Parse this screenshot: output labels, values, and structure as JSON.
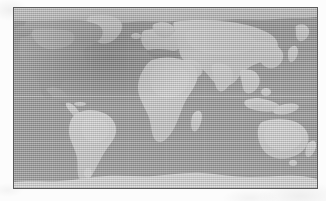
{
  "image": {
    "kind": "world-map",
    "title": "World Map",
    "projection": "equirectangular",
    "style": "grayscale halftone scanline",
    "width_px": 326,
    "height_px": 201,
    "alt_text": "Low-contrast grayscale world map with horizontal scanline texture inside a thin dark rectangular border"
  },
  "frame": {
    "border_color": "#5a5a5a",
    "border_width_px": 1,
    "left_px": 13,
    "top_px": 7,
    "width_px": 305,
    "height_px": 182
  },
  "colors": {
    "page_background": "#fcfcfc",
    "ocean": "#9b9b9b",
    "land": "#c9c9c9",
    "land_shadow": "#8e8e8e",
    "antarctica": "#d2d2d2",
    "border": "#5a5a5a",
    "graticule": "#ffffff"
  },
  "map": {
    "landmasses": [
      {
        "name": "north-america",
        "label": "North America"
      },
      {
        "name": "greenland",
        "label": "Greenland"
      },
      {
        "name": "south-america",
        "label": "South America"
      },
      {
        "name": "africa",
        "label": "Africa"
      },
      {
        "name": "europe",
        "label": "Europe"
      },
      {
        "name": "asia",
        "label": "Asia"
      },
      {
        "name": "australia",
        "label": "Australia"
      },
      {
        "name": "new-zealand",
        "label": "New Zealand"
      },
      {
        "name": "madagascar",
        "label": "Madagascar"
      },
      {
        "name": "antarctica",
        "label": "Antarctica"
      },
      {
        "name": "japan",
        "label": "Japan"
      },
      {
        "name": "indonesia",
        "label": "Indonesia"
      },
      {
        "name": "british-isles",
        "label": "British Isles"
      },
      {
        "name": "iceland",
        "label": "Iceland"
      }
    ],
    "graticule": {
      "visible": true,
      "equator_visible": true,
      "meridian_spacing_px": 38,
      "parallels_px": [
        45,
        88,
        134
      ]
    }
  },
  "labels": {
    "none_visible": ""
  }
}
